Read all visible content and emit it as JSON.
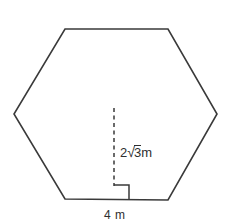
{
  "figure": {
    "type": "regular-hexagon-with-apothem",
    "shape_name": "hexagon",
    "stroke_color": "#3a3a3a",
    "background_color": "#ffffff",
    "vertices": [
      [
        65,
        29
      ],
      [
        168,
        29
      ],
      [
        217,
        114
      ],
      [
        168,
        200
      ],
      [
        65,
        199
      ],
      [
        14,
        114
      ]
    ],
    "apothem_line": {
      "style": "dashed",
      "from": [
        114,
        108
      ],
      "to": [
        114,
        186
      ]
    },
    "right_angle_marker": {
      "x": 114,
      "y": 185,
      "size": 15
    }
  },
  "labels": {
    "apothem": {
      "coefficient": "2",
      "radical_symbol": "√",
      "radicand": "3",
      "unit": "m",
      "full_text": "2√3m"
    },
    "side": {
      "value": "4",
      "unit": "m",
      "full_text": "4 m"
    }
  }
}
